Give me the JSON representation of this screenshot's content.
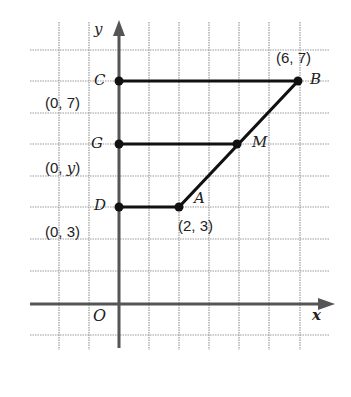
{
  "axes": {
    "x_label": "x",
    "y_label": "y",
    "origin_label": "O"
  },
  "points": {
    "C": {
      "label": "C",
      "coord": "(0, 7)"
    },
    "G": {
      "label": "G",
      "coord": "(0, y)"
    },
    "D": {
      "label": "D",
      "coord": "(0, 3)"
    },
    "A": {
      "label": "A",
      "coord": "(2, 3)"
    },
    "B": {
      "label": "B",
      "coord": "(6, 7)"
    },
    "M": {
      "label": "M"
    }
  },
  "segments": [
    "CB",
    "GM",
    "DA",
    "AB"
  ],
  "colors": {
    "grid": "#9a9a9a",
    "axis": "#555555",
    "line": "#111111"
  }
}
